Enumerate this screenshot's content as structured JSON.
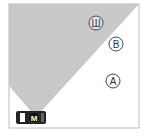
{
  "diagram": {
    "frame": {
      "x": 9,
      "y": 4,
      "w": 130,
      "h": 124,
      "stroke": "#bbbbbb"
    },
    "cone": {
      "fill": "#c8c8c8",
      "points": "9,4 139,4 36,117 9,86"
    },
    "points": [
      {
        "id": "sh",
        "label": "Ш",
        "cx": 96,
        "cy": 23
      },
      {
        "id": "b",
        "label": "B",
        "cx": 116,
        "cy": 44
      },
      {
        "id": "a",
        "label": "A",
        "cx": 113,
        "cy": 81
      }
    ],
    "car": {
      "label": "M",
      "x": 16,
      "y": 111,
      "w": 30,
      "h": 13
    }
  }
}
